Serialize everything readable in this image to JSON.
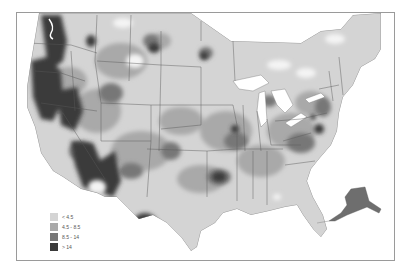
{
  "map": {
    "type": "choropleth",
    "region": "United States (contiguous) with Alaska inset",
    "palette": {
      "background": "#ffffff",
      "class_1": "#d4d4d4",
      "class_2": "#a9a9a9",
      "class_3": "#777777",
      "class_4": "#3a3a3a",
      "no_data": "#f4f4f4",
      "state_lines": "#5a5a5a",
      "lakes": "#ffffff",
      "frame": "#9a9a9a"
    }
  },
  "legend": {
    "items": [
      {
        "label": "< 4.5",
        "color": "#d4d4d4"
      },
      {
        "label": "4.5 - 8.5",
        "color": "#a9a9a9"
      },
      {
        "label": "8.5 - 14",
        "color": "#777777"
      },
      {
        "label": "> 14",
        "color": "#3a3a3a"
      }
    ]
  }
}
